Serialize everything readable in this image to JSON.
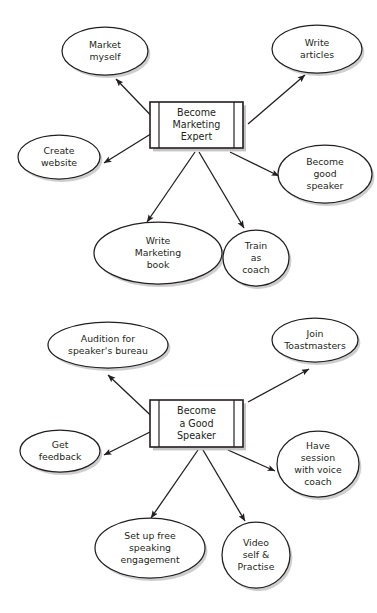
{
  "document": {
    "title": "Goal Breakdown Mind Maps",
    "background_color": "#ffffff",
    "line_color": "#231f20",
    "shadow_color": "#bdbdbd"
  },
  "diagrams": [
    {
      "id": "marketing-expert-map",
      "name": "Become Marketing Expert mind map",
      "hub": {
        "name": "hub-become-marketing-expert",
        "lines": [
          "Become",
          "Marketing",
          "Expert"
        ],
        "x": 150,
        "y": 102,
        "width": 93,
        "height": 46
      },
      "nodes": [
        {
          "id": "market-myself",
          "name": "node-market-myself",
          "shape": "ellipse",
          "lines": [
            "Market",
            "myself"
          ],
          "cx": 105,
          "cy": 51,
          "rx": 43,
          "ry": 24
        },
        {
          "id": "write-articles",
          "name": "node-write-articles",
          "shape": "ellipse",
          "lines": [
            "Write",
            "articles"
          ],
          "cx": 317,
          "cy": 49,
          "rx": 45,
          "ry": 24
        },
        {
          "id": "create-website",
          "name": "node-create-website",
          "shape": "ellipse",
          "lines": [
            "Create",
            "website"
          ],
          "cx": 59,
          "cy": 157,
          "rx": 41,
          "ry": 22
        },
        {
          "id": "become-good-speaker",
          "name": "node-become-good-speaker",
          "shape": "ellipse",
          "lines": [
            "Become",
            "good",
            "speaker"
          ],
          "cx": 325,
          "cy": 174,
          "rx": 47,
          "ry": 29
        },
        {
          "id": "write-marketing-book",
          "name": "node-write-marketing-book",
          "shape": "ellipse",
          "lines": [
            "Write",
            "Marketing",
            "book"
          ],
          "cx": 158,
          "cy": 253,
          "rx": 64,
          "ry": 31
        },
        {
          "id": "train-as-coach",
          "name": "node-train-as-coach",
          "shape": "circle",
          "lines": [
            "Train",
            "as",
            "coach"
          ],
          "cx": 256,
          "cy": 258,
          "rx": 33,
          "ry": 28
        }
      ]
    },
    {
      "id": "good-speaker-map",
      "name": "Become a Good Speaker mind map",
      "hub": {
        "name": "hub-become-a-good-speaker",
        "lines": [
          "Become",
          "a Good",
          "Speaker"
        ],
        "x": 150,
        "y": 400,
        "width": 93,
        "height": 47
      },
      "nodes": [
        {
          "id": "audition-speakers-bureau",
          "name": "node-audition-for-speakers-bureau",
          "shape": "ellipse",
          "lines": [
            "Audition for",
            "speaker's bureau"
          ],
          "cx": 108,
          "cy": 345,
          "rx": 60,
          "ry": 23
        },
        {
          "id": "join-toastmasters",
          "name": "node-join-toastmasters",
          "shape": "ellipse",
          "lines": [
            "Join",
            "Toastmasters"
          ],
          "cx": 315,
          "cy": 340,
          "rx": 43,
          "ry": 22
        },
        {
          "id": "get-feedback",
          "name": "node-get-feedback",
          "shape": "ellipse",
          "lines": [
            "Get",
            "feedback"
          ],
          "cx": 60,
          "cy": 451,
          "rx": 40,
          "ry": 21
        },
        {
          "id": "have-session-voice-coach",
          "name": "node-have-session-with-voice-coach",
          "shape": "ellipse",
          "lines": [
            "Have",
            "session",
            "with voice",
            "coach"
          ],
          "cx": 318,
          "cy": 464,
          "rx": 41,
          "ry": 33
        },
        {
          "id": "set-up-free-speaking",
          "name": "node-set-up-free-speaking-engagement",
          "shape": "ellipse",
          "lines": [
            "Set up free",
            "speaking",
            "engagement"
          ],
          "cx": 150,
          "cy": 548,
          "rx": 55,
          "ry": 30
        },
        {
          "id": "video-self-practise",
          "name": "node-video-self-and-practise",
          "shape": "circle",
          "lines": [
            "Video",
            "self &",
            "Practise"
          ],
          "cx": 256,
          "cy": 555,
          "rx": 34,
          "ry": 33
        }
      ]
    }
  ],
  "edges": [
    {
      "name": "edge-hub1-to-market-myself",
      "from": "hub-marketing",
      "to": "market-myself",
      "x1": 162,
      "y1": 127,
      "x2": 116,
      "y2": 79
    },
    {
      "name": "edge-hub1-to-create-website",
      "from": "hub-marketing",
      "to": "create-website",
      "x1": 162,
      "y1": 127,
      "x2": 104,
      "y2": 163
    },
    {
      "name": "edge-hub1-to-write-articles",
      "from": "hub-marketing",
      "to": "write-articles",
      "x1": 248,
      "y1": 124,
      "x2": 305,
      "y2": 75
    },
    {
      "name": "edge-hub1-to-become-good-speaker",
      "from": "hub-marketing",
      "to": "become-good-speaker",
      "x1": 230,
      "y1": 152,
      "x2": 279,
      "y2": 176
    },
    {
      "name": "edge-hub1-to-write-marketing-book",
      "from": "hub-marketing",
      "to": "write-marketing-book",
      "x1": 195,
      "y1": 152,
      "x2": 147,
      "y2": 222
    },
    {
      "name": "edge-hub1-to-train-as-coach",
      "from": "hub-marketing",
      "to": "train-as-coach",
      "x1": 199,
      "y1": 152,
      "x2": 244,
      "y2": 228
    },
    {
      "name": "edge-hub2-to-audition",
      "from": "hub-speaker",
      "to": "audition-speakers-bureau",
      "x1": 162,
      "y1": 426,
      "x2": 108,
      "y2": 375
    },
    {
      "name": "edge-hub2-to-get-feedback",
      "from": "hub-speaker",
      "to": "get-feedback",
      "x1": 162,
      "y1": 426,
      "x2": 104,
      "y2": 455
    },
    {
      "name": "edge-hub2-to-join-toastmasters",
      "from": "hub-speaker",
      "to": "join-toastmasters",
      "x1": 248,
      "y1": 402,
      "x2": 309,
      "y2": 369
    },
    {
      "name": "edge-hub2-to-have-session",
      "from": "hub-speaker",
      "to": "have-session-voice-coach",
      "x1": 228,
      "y1": 450,
      "x2": 275,
      "y2": 471
    },
    {
      "name": "edge-hub2-to-set-up-free-speaking",
      "from": "hub-speaker",
      "to": "set-up-free-speaking",
      "x1": 198,
      "y1": 450,
      "x2": 151,
      "y2": 518
    },
    {
      "name": "edge-hub2-to-video-self",
      "from": "hub-speaker",
      "to": "video-self-practise",
      "x1": 203,
      "y1": 450,
      "x2": 245,
      "y2": 521
    }
  ]
}
